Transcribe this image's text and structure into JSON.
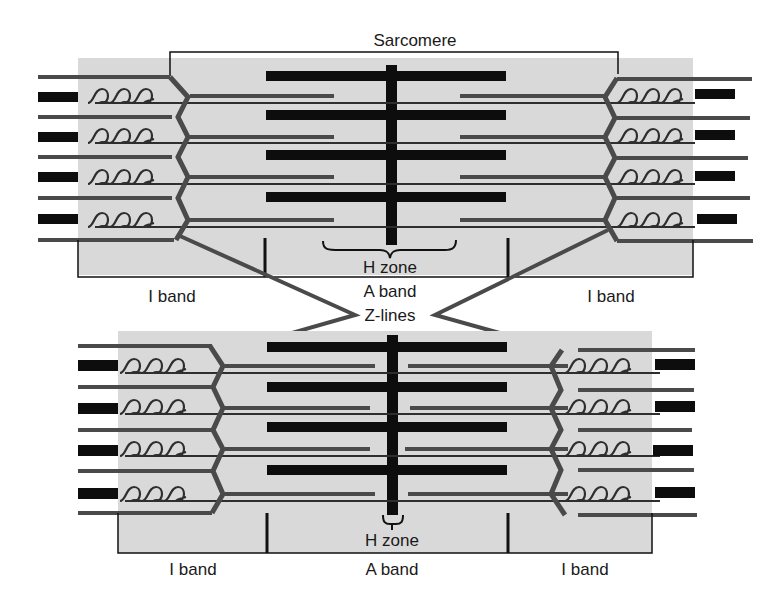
{
  "figure": {
    "title": "Sarcomere",
    "colors": {
      "background": "#ffffff",
      "band_shading": "#d9d9d9",
      "thick_filament": "#0d0d0d",
      "thin_filament": "#4a4a4a",
      "titin": "#2e2e2e",
      "outline": "#111111"
    }
  },
  "labels": {
    "sarcomere": "Sarcomere",
    "top": {
      "i_band_left": "I band",
      "h_zone": "H zone",
      "a_band": "A band",
      "i_band_right": "I band"
    },
    "z_lines": "Z-lines",
    "bottom": {
      "i_band_left": "I band",
      "h_zone": "H zone",
      "a_band": "A band",
      "i_band_right": "I band"
    }
  },
  "states": [
    {
      "name": "relaxed",
      "position": "top",
      "filament_rows": 4
    },
    {
      "name": "contracted",
      "position": "bottom",
      "filament_rows": 4
    }
  ]
}
